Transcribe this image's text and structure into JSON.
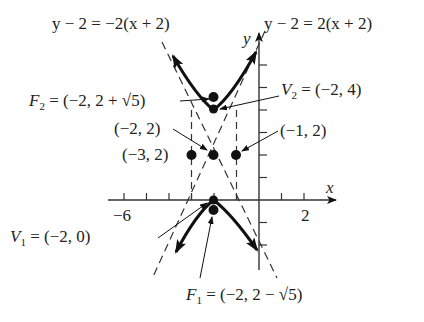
{
  "diagram": {
    "type": "hyperbola",
    "center": "(-2, 2)",
    "asymptotes": {
      "left": "y − 2 = −2(x + 2)",
      "right": "y − 2 = 2(x + 2)"
    },
    "axes": {
      "x_label": "x",
      "y_label": "y",
      "tick_left": "−6",
      "tick_right": "2"
    },
    "labels": {
      "F2_name": "F",
      "F2_sub": "2",
      "F2_value": " = (−2, 2 + √5)",
      "V2_name": "V",
      "V2_sub": "2",
      "V2_value": " = (−2, 4)",
      "center": "(−2, 2)",
      "left_point": "(−3, 2)",
      "right_point": "(−1, 2)",
      "V1_name": "V",
      "V1_sub": "1",
      "V1_value": " = (−2, 0)",
      "F1_name": "F",
      "F1_sub": "1",
      "F1_value": " = (−2, 2 − √5)"
    },
    "points": [
      {
        "name": "F2",
        "x": -2,
        "y": 4.236
      },
      {
        "name": "V2",
        "x": -2,
        "y": 4
      },
      {
        "name": "center",
        "x": -2,
        "y": 2
      },
      {
        "name": "left",
        "x": -3,
        "y": 2
      },
      {
        "name": "right",
        "x": -1,
        "y": 2
      },
      {
        "name": "V1",
        "x": -2,
        "y": 0
      },
      {
        "name": "F1",
        "x": -2,
        "y": -0.236
      }
    ]
  }
}
